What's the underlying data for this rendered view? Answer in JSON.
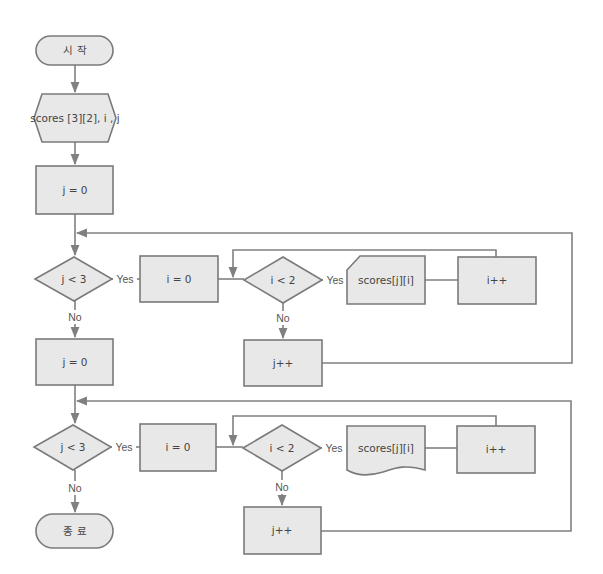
{
  "colors": {
    "shape_fill": "#e8e8e8",
    "stroke": "#7a7a7a",
    "line": "#808080",
    "text": "#444444"
  },
  "nodes": {
    "start": {
      "label": "시 작",
      "type": "terminal"
    },
    "declare": {
      "label": "scores [3][2], i , j",
      "type": "preparation"
    },
    "j_init_1": {
      "label": "j = 0",
      "type": "process"
    },
    "cond_j_1": {
      "label": "j < 3",
      "type": "decision"
    },
    "i_init_1": {
      "label": "i = 0",
      "type": "process"
    },
    "cond_i_1": {
      "label": "i < 2",
      "type": "decision"
    },
    "input_scores": {
      "label": "scores[j][i]",
      "type": "manual-input"
    },
    "i_inc_1": {
      "label": "i++",
      "type": "process"
    },
    "j_inc_1": {
      "label": "j++",
      "type": "process"
    },
    "j_init_2": {
      "label": "j = 0",
      "type": "process"
    },
    "cond_j_2": {
      "label": "j < 3",
      "type": "decision"
    },
    "i_init_2": {
      "label": "i = 0",
      "type": "process"
    },
    "cond_i_2": {
      "label": "i < 2",
      "type": "decision"
    },
    "output_scores": {
      "label": "scores[j][i]",
      "type": "document"
    },
    "i_inc_2": {
      "label": "i++",
      "type": "process"
    },
    "j_inc_2": {
      "label": "j++",
      "type": "process"
    },
    "end": {
      "label": "종 료",
      "type": "terminal"
    }
  },
  "edge_labels": {
    "yes": "Yes",
    "no": "No"
  }
}
